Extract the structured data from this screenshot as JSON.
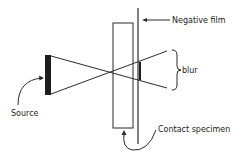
{
  "diagram": {
    "labels": {
      "negative_film": "Negative film",
      "blur": "blur",
      "source": "Source",
      "contact_specimen": "Contact specimen"
    },
    "colors": {
      "stroke": "#2a2a2a",
      "fill_dark": "#1e1e1e",
      "background": "#ffffff"
    }
  }
}
